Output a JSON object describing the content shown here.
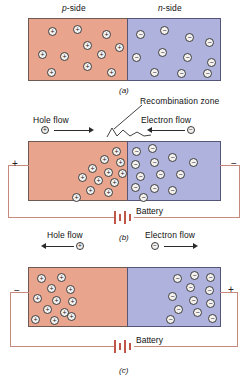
{
  "figure": {
    "title_alt": "p-n junction diode under three bias conditions",
    "colors": {
      "p_region": "#e8a48c",
      "n_region": "#aeb2dd",
      "wire": "#c98a7e",
      "battery_plate": "#c0564a",
      "carrier_fill": "#f4f2f0",
      "carrier_stroke": "#3a3a3a",
      "text": "#111111"
    }
  },
  "panel_a": {
    "letter": "(a)",
    "p_side_label_italic": "p",
    "p_side_label_rest": "-side",
    "n_side_label_italic": "n",
    "n_side_label_rest": "-side",
    "hole_symbol": "+",
    "electron_symbol": "−",
    "hole_count": 10,
    "electron_count": 11,
    "description": "Unbiased p-n junction: holes uniformly spread in p-side, electrons uniformly spread in n-side"
  },
  "panel_b": {
    "letter": "(b)",
    "recombination_label": "Recombination zone",
    "hole_flow_label": "Hole flow",
    "electron_flow_label": "Electron flow",
    "hole_symbol": "+",
    "electron_symbol": "−",
    "hole_arrow_direction": "right",
    "electron_arrow_direction": "left",
    "left_terminal": "+",
    "right_terminal": "−",
    "battery_label": "Battery",
    "bias": "forward bias",
    "hole_count": 12,
    "electron_count": 13,
    "description": "Forward bias: carriers driven toward the junction where they recombine"
  },
  "panel_c": {
    "letter": "(c)",
    "hole_flow_label": "Hole flow",
    "electron_flow_label": "Electron flow",
    "hole_symbol": "+",
    "electron_symbol": "−",
    "hole_arrow_direction": "left",
    "electron_arrow_direction": "right",
    "left_terminal": "−",
    "right_terminal": "+",
    "battery_label": "Battery",
    "bias": "reverse bias",
    "hole_count": 12,
    "electron_count": 12,
    "description": "Reverse bias: carriers pulled away from the junction widening the depletion zone"
  }
}
